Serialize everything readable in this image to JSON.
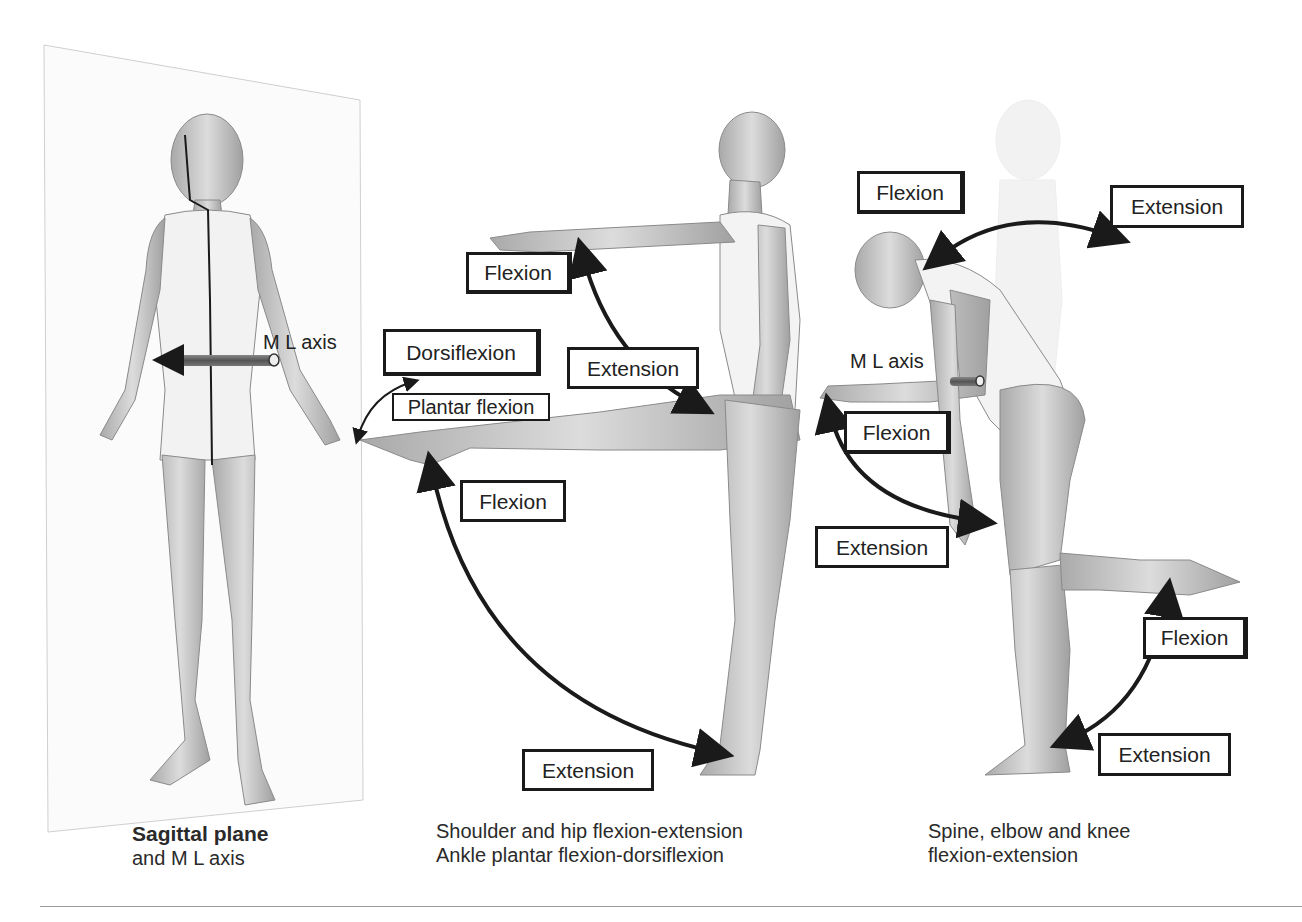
{
  "figure": {
    "panels": [
      {
        "id": "sagittal-plane",
        "caption_bold": "Sagittal plane",
        "caption_rest": "and M L axis",
        "axis_label": "M L axis"
      },
      {
        "id": "shoulder-hip-ankle",
        "caption_line1": "Shoulder and hip flexion-extension",
        "caption_line2": "Ankle plantar flexion-dorsiflexion",
        "labels": {
          "shoulder_flexion": "Flexion",
          "shoulder_extension": "Extension",
          "dorsiflexion": "Dorsiflexion",
          "plantar_flexion": "Plantar flexion",
          "hip_flexion": "Flexion",
          "hip_extension": "Extension"
        }
      },
      {
        "id": "spine-elbow-knee",
        "caption_line1": "Spine, elbow and knee",
        "caption_line2": "flexion-extension",
        "axis_label": "M L axis",
        "labels": {
          "spine_flexion": "Flexion",
          "spine_extension": "Extension",
          "elbow_flexion": "Flexion",
          "elbow_extension": "Extension",
          "knee_flexion": "Flexion",
          "knee_extension": "Extension"
        }
      }
    ],
    "colors": {
      "line": "#1a1a1a",
      "skin": "#c8c8c8",
      "plane": "#d8d8d8"
    }
  }
}
